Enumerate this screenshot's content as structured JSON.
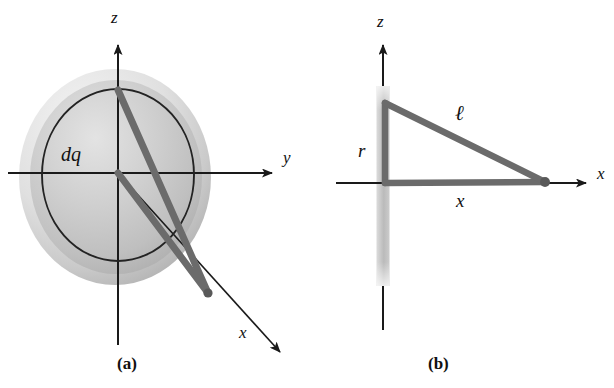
{
  "figure": {
    "panels": [
      {
        "id": "a",
        "caption": "(a)",
        "description": "Charged disk in the y-z plane with a ring element dq and field point on the x axis",
        "labels": {
          "z_axis": "z",
          "y_axis": "y",
          "x_axis": "x",
          "charge_element": "dq"
        },
        "geometry": {
          "origin": [
            118,
            173
          ],
          "disk_center": [
            115,
            177
          ],
          "disk_radius_x": 96,
          "disk_radius_y": 108,
          "inner_ring_center": [
            118,
            175
          ],
          "inner_ring_radius_x": 76,
          "inner_ring_radius_y": 86,
          "field_point": [
            208,
            293
          ],
          "ring_top_point": [
            118,
            90
          ]
        },
        "colors": {
          "disk_fill": "#c4c4c4",
          "disk_rim": "#dcdcdc",
          "line_gray": "#6b6b6b",
          "axis_black": "#1a1a1a",
          "ring_stroke": "#222222"
        }
      },
      {
        "id": "b",
        "caption": "(b)",
        "description": "Edge-on cross section of the disk showing radius r, distance x and slant distance l",
        "labels": {
          "z_axis": "z",
          "x_axis": "x",
          "radius": "r",
          "slant_distance": "ℓ",
          "distance": "x"
        },
        "geometry": {
          "origin": [
            385,
            183
          ],
          "rod_center_x": 383,
          "rod_top": [
            383,
            86
          ],
          "rod_bottom": [
            383,
            286
          ],
          "rod_width": 13,
          "ring_edge_point": [
            385,
            103
          ],
          "field_point": [
            545,
            182
          ]
        },
        "colors": {
          "rod_fill": "#bdbdbd",
          "line_gray": "#6b6b6b",
          "axis_black": "#1a1a1a"
        }
      }
    ]
  }
}
